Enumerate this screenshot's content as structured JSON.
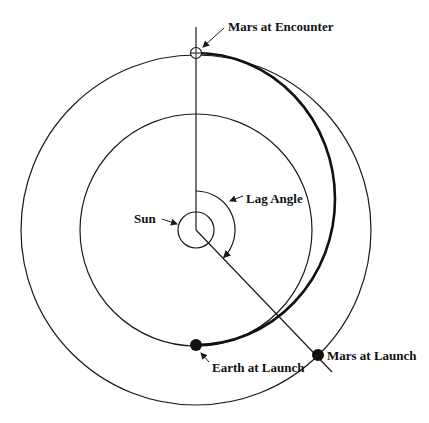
{
  "diagram": {
    "type": "orbital-transfer",
    "labels": {
      "mars_encounter": "Mars at Encounter",
      "lag_angle": "Lag Angle",
      "sun": "Sun",
      "earth_launch": "Earth at Launch",
      "mars_launch": "Mars at Launch"
    },
    "colors": {
      "line": "#1a1a1a",
      "background": "#ffffff"
    },
    "elements": {
      "sun": {
        "cx": 196,
        "cy": 230,
        "r": 18
      },
      "earth_orbit": {
        "cx": 196,
        "cy": 230,
        "r": 116
      },
      "mars_orbit": {
        "cx": 196,
        "cy": 230,
        "r": 175
      },
      "earth_at_launch": {
        "x": 196,
        "y": 345
      },
      "mars_at_launch": {
        "x": 318,
        "y": 355
      },
      "mars_at_encounter": {
        "x": 196,
        "y": 53
      },
      "lag_angle_deg": 135
    }
  }
}
